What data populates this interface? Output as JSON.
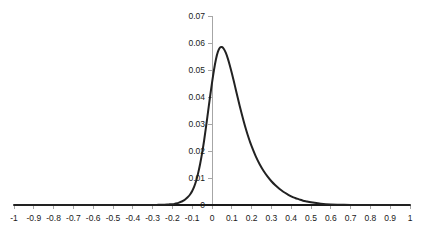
{
  "chart_data": {
    "type": "line",
    "title": "",
    "subtitle": "",
    "xlabel": "",
    "ylabel": "",
    "xlim": [
      -1,
      1
    ],
    "ylim": [
      0,
      0.07
    ],
    "grid": false,
    "legend": null,
    "legend_position": "none",
    "annotations": [],
    "line_color": "#222222",
    "axis_color": "#a6a6a6",
    "baseline_color": "#1a1a1a",
    "text_color": "#1a1a1a",
    "background_color": "#ffffff",
    "x_tick_labels": [
      "-1",
      "-0.9",
      "-0.8",
      "-0.7",
      "-0.6",
      "-0.5",
      "-0.4",
      "-0.3",
      "-0.2",
      "-0.1",
      "0",
      "0.1",
      "0.2",
      "0.3",
      "0.4",
      "0.5",
      "0.6",
      "0.7",
      "0.8",
      "0.9",
      "1"
    ],
    "x_ticks": [
      -1,
      -0.9,
      -0.8,
      -0.7,
      -0.6,
      -0.5,
      -0.4,
      -0.3,
      -0.2,
      -0.1,
      0,
      0.1,
      0.2,
      0.3,
      0.4,
      0.5,
      0.6,
      0.7,
      0.8,
      0.9,
      1
    ],
    "y_tick_labels": [
      "0",
      "0.01",
      "0.02",
      "0.03",
      "0.04",
      "0.05",
      "0.06",
      "0.07"
    ],
    "y_ticks": [
      0,
      0.01,
      0.02,
      0.03,
      0.04,
      0.05,
      0.06,
      0.07
    ],
    "series": [
      {
        "name": "density",
        "x": [
          -1.0,
          -0.95,
          -0.9,
          -0.85,
          -0.8,
          -0.75,
          -0.7,
          -0.65,
          -0.6,
          -0.55,
          -0.5,
          -0.45,
          -0.4,
          -0.35,
          -0.3,
          -0.28,
          -0.26,
          -0.24,
          -0.22,
          -0.2,
          -0.19,
          -0.18,
          -0.17,
          -0.16,
          -0.15,
          -0.14,
          -0.13,
          -0.12,
          -0.11,
          -0.1,
          -0.09,
          -0.08,
          -0.07,
          -0.06,
          -0.05,
          -0.04,
          -0.03,
          -0.02,
          -0.01,
          0.0,
          0.01,
          0.02,
          0.03,
          0.04,
          0.05,
          0.06,
          0.07,
          0.08,
          0.09,
          0.1,
          0.11,
          0.12,
          0.13,
          0.14,
          0.15,
          0.16,
          0.17,
          0.18,
          0.19,
          0.2,
          0.22,
          0.24,
          0.26,
          0.28,
          0.3,
          0.32,
          0.34,
          0.36,
          0.38,
          0.4,
          0.42,
          0.44,
          0.46,
          0.48,
          0.5,
          0.55,
          0.6,
          0.65,
          0.7,
          0.75,
          0.8,
          0.85,
          0.9,
          0.95,
          1.0
        ],
        "y": [
          0.0,
          0.0,
          0.0,
          0.0,
          0.0,
          0.0,
          0.0,
          0.0,
          0.0,
          0.0,
          0.0,
          0.0,
          0.0,
          0.0,
          0.0,
          0.0,
          0.0001,
          0.0001,
          0.0002,
          0.0003,
          0.0004,
          0.0006,
          0.0008,
          0.0011,
          0.0014,
          0.0018,
          0.0024,
          0.0031,
          0.004,
          0.0052,
          0.0068,
          0.009,
          0.0118,
          0.0152,
          0.0192,
          0.0238,
          0.029,
          0.0345,
          0.04,
          0.0452,
          0.05,
          0.054,
          0.0568,
          0.0583,
          0.0585,
          0.0578,
          0.0563,
          0.0542,
          0.0517,
          0.0489,
          0.0459,
          0.0428,
          0.0397,
          0.0367,
          0.0338,
          0.031,
          0.0284,
          0.026,
          0.0238,
          0.0218,
          0.0182,
          0.0152,
          0.0127,
          0.0106,
          0.0088,
          0.0073,
          0.006,
          0.0049,
          0.004,
          0.0032,
          0.0026,
          0.0021,
          0.0016,
          0.0013,
          0.001,
          0.0005,
          0.0002,
          0.0001,
          0.0,
          0.0,
          0.0,
          0.0,
          0.0,
          0.0,
          0.0
        ]
      }
    ]
  },
  "plot_geometry": {
    "left_px": 14,
    "right_px": 410,
    "baseline_y_px": 205,
    "top_y_px": 16,
    "y_axis_x_px": 212
  }
}
